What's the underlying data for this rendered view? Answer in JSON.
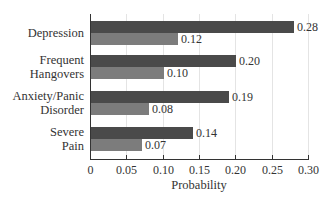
{
  "chart_data": {
    "type": "bar",
    "orientation": "horizontal",
    "title": "",
    "xlabel": "Probability",
    "ylabel": "",
    "xlim": [
      0,
      0.3
    ],
    "xticks": [
      "0",
      "0.05",
      "0.10",
      "0.15",
      "0.20",
      "0.25",
      "0.30"
    ],
    "grid": true,
    "legend": null,
    "categories": [
      "Depression",
      "Frequent\nHangovers",
      "Anxiety/Panic\nDisorder",
      "Severe\nPain"
    ],
    "series": [
      {
        "name": "Series 1 (dark)",
        "color": "#4a4a4a",
        "values": [
          0.28,
          0.2,
          0.19,
          0.14
        ],
        "labels": [
          "0.28",
          "0.20",
          "0.19",
          "0.14"
        ]
      },
      {
        "name": "Series 2 (light)",
        "color": "#7c7c7c",
        "values": [
          0.12,
          0.1,
          0.08,
          0.07
        ],
        "labels": [
          "0.12",
          "0.10",
          "0.08",
          "0.07"
        ]
      }
    ]
  }
}
